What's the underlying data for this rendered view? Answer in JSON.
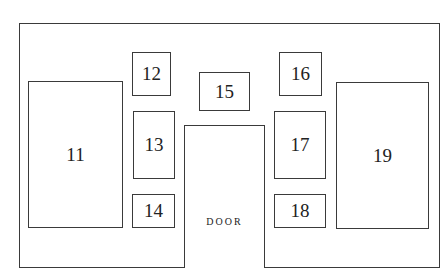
{
  "diagram": {
    "type": "wall layout",
    "door_label": "DOOR",
    "boxes": [
      {
        "id": "11",
        "label": "11"
      },
      {
        "id": "12",
        "label": "12"
      },
      {
        "id": "13",
        "label": "13"
      },
      {
        "id": "14",
        "label": "14"
      },
      {
        "id": "15",
        "label": "15"
      },
      {
        "id": "16",
        "label": "16"
      },
      {
        "id": "17",
        "label": "17"
      },
      {
        "id": "18",
        "label": "18"
      },
      {
        "id": "19",
        "label": "19"
      }
    ],
    "colors": {
      "line": "#3a3a3a",
      "background": "#ffffff",
      "text": "#222222"
    }
  }
}
